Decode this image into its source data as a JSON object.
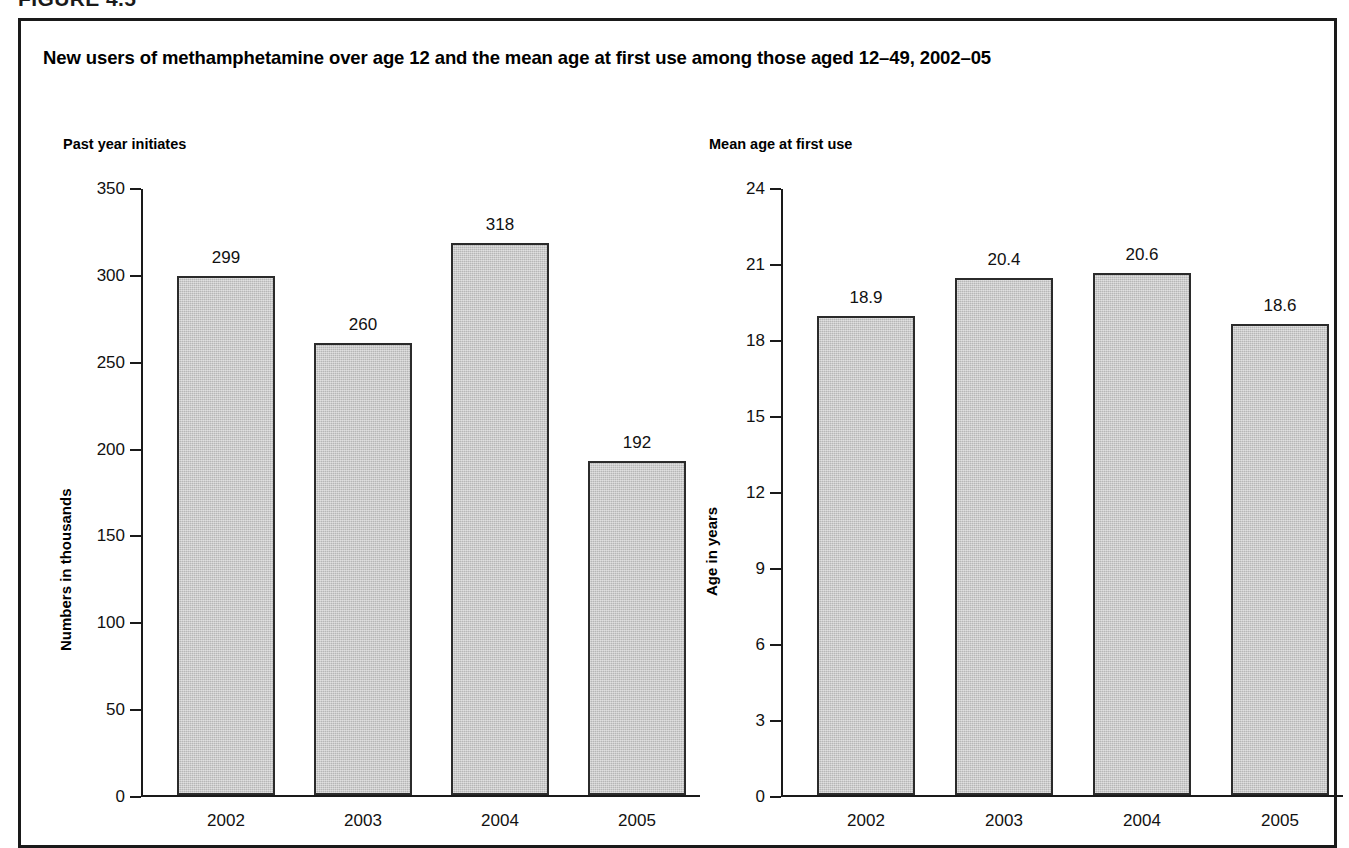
{
  "figure": {
    "number_label": "FIGURE 4.5",
    "title": "New users of methamphetamine over age 12 and the mean age at first use among those aged 12–49, 2002–05"
  },
  "colors": {
    "bar_fill": "#c6c6c6",
    "bar_border": "#2b2b2b",
    "axis": "#1a1a1a",
    "text": "#000000",
    "frame": "#1a1a1a"
  },
  "chart_data": [
    {
      "type": "bar",
      "title": "Past year initiates",
      "xlabel": "",
      "ylabel": "Numbers in thousands",
      "categories": [
        "2002",
        "2003",
        "2004",
        "2005"
      ],
      "values": [
        299,
        260,
        318,
        192
      ],
      "value_labels": [
        "299",
        "260",
        "318",
        "192"
      ],
      "ylim": [
        0,
        350
      ],
      "yticks": [
        0,
        50,
        100,
        150,
        200,
        250,
        300,
        350
      ],
      "ytick_labels": [
        "0",
        "50",
        "100",
        "150",
        "200",
        "250",
        "300",
        "350"
      ],
      "grid": false,
      "legend": "none"
    },
    {
      "type": "bar",
      "title": "Mean age at first use",
      "xlabel": "",
      "ylabel": "Age in years",
      "categories": [
        "2002",
        "2003",
        "2004",
        "2005"
      ],
      "values": [
        18.9,
        20.4,
        20.6,
        18.6
      ],
      "value_labels": [
        "18.9",
        "20.4",
        "20.6",
        "18.6"
      ],
      "ylim": [
        0,
        24
      ],
      "yticks": [
        0,
        3,
        6,
        9,
        12,
        15,
        18,
        21,
        24
      ],
      "ytick_labels": [
        "0",
        "3",
        "6",
        "9",
        "12",
        "15",
        "18",
        "21",
        "24"
      ],
      "grid": false,
      "legend": "none"
    }
  ]
}
